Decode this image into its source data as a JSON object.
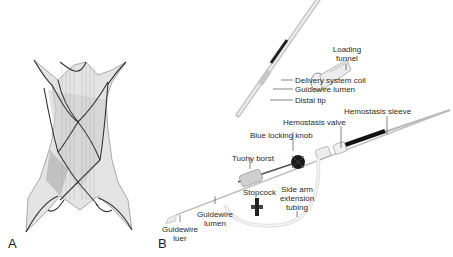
{
  "figure": {
    "panels": [
      {
        "letter": "A",
        "subject": "valve-stent-frame"
      },
      {
        "letter": "B",
        "subject": "delivery-system"
      }
    ],
    "labels": {
      "delivery_system_coil": "Delivery system coil",
      "guidewire_lumen_top": "Guidewire lumen",
      "distal_tip": "Distal tip",
      "loading_funnel_1": "Loading",
      "loading_funnel_2": "funnel",
      "hemostasis_sleeve": "Hemostasis sleeve",
      "hemostasis_valve": "Hemostasis valve",
      "blue_locking_knob": "Blue locking knob",
      "tuohy_borst": "Tuohy borst",
      "stopcock": "Stopcock",
      "side_arm_1": "Side arm",
      "side_arm_2": "extension",
      "side_arm_3": "tubing",
      "guidewire_lumen_1": "Guidewire",
      "guidewire_lumen_2": "lumen",
      "guidewire_luer_1": "Guidewire",
      "guidewire_luer_2": "luer"
    }
  }
}
